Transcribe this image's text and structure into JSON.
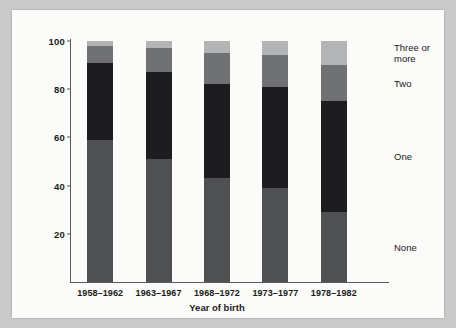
{
  "chart_data": {
    "type": "bar",
    "subtype": "stacked-percent-column",
    "title": "",
    "xlabel": "Year of birth",
    "ylabel": "Percent of females cohabiting",
    "categories": [
      "1958–1962",
      "1963–1967",
      "1968–1972",
      "1973–1977",
      "1978–1982"
    ],
    "ylim": [
      0,
      100
    ],
    "yticks": [
      20,
      40,
      60,
      80,
      100
    ],
    "ytick_labels": [
      "20",
      "40",
      "60",
      "80",
      "100"
    ],
    "grid": false,
    "legend_position": "right",
    "stack_order_bottom_to_top": [
      "None",
      "One",
      "Two",
      "Three or more"
    ],
    "series": [
      {
        "name": "None",
        "color": "#4f5052",
        "values": [
          59,
          51,
          43,
          39,
          29
        ]
      },
      {
        "name": "One",
        "color": "#1d1d1f",
        "values": [
          32,
          36,
          39,
          42,
          46
        ]
      },
      {
        "name": "Two",
        "color": "#6f7173",
        "values": [
          7,
          10,
          13,
          13,
          15
        ]
      },
      {
        "name": "Three or more",
        "color": "#b3b4b6",
        "values": [
          2,
          3,
          5,
          6,
          10
        ]
      }
    ],
    "legend_entries": [
      {
        "label": "Three or\nmore",
        "color": "#b3b4b6"
      },
      {
        "label": "Two",
        "color": "#6f7173"
      },
      {
        "label": "One",
        "color": "#1d1d1f"
      },
      {
        "label": "None",
        "color": "#4f5052"
      }
    ],
    "colors": {
      "none": "#4f5052",
      "one": "#1d1d1f",
      "two": "#6f7173",
      "three_or_more": "#b3b4b6",
      "axis": "#58595b",
      "text": "#1a1a1a",
      "card_background": "#fbfbfa",
      "page_background": "#c9c9c9"
    }
  }
}
